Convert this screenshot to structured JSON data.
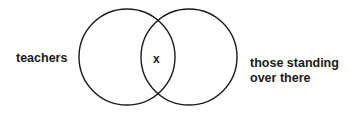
{
  "diagram": {
    "type": "venn",
    "sets": [
      {
        "label": "teachers",
        "cx": 127,
        "cy": 57,
        "r": 48
      },
      {
        "label": "those standing over there",
        "cx": 189,
        "cy": 57,
        "r": 48
      }
    ],
    "intersection_label": "x",
    "stroke_color": "#1a1a1a"
  },
  "labels": {
    "left": "teachers",
    "intersection": "x",
    "right_line1": "those standing",
    "right_line2": "over there"
  }
}
